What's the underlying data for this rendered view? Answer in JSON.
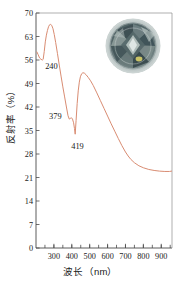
{
  "figure": {
    "name": "reflectance-spectrum-figure",
    "background": "#ffffff",
    "curve_color": "#d98c72",
    "axis_color": "#4a4a4a"
  },
  "axes": {
    "x_title": "波长（nm）",
    "y_title": "反射率（%）",
    "x_ticks": [
      "300",
      "400",
      "500",
      "600",
      "700",
      "800",
      "900"
    ],
    "y_ticks": [
      "0",
      "7",
      "14",
      "21",
      "28",
      "35",
      "42",
      "49",
      "56",
      "63",
      "70"
    ]
  },
  "annotations": [
    {
      "label": "240",
      "meaning": "absorption-dip-240nm"
    },
    {
      "label": "379",
      "meaning": "shoulder-379nm"
    },
    {
      "label": "419",
      "meaning": "absorption-minimum-419nm"
    }
  ],
  "inset": {
    "name": "gemstone-photo",
    "description": "round brilliant cut gemstone",
    "colors": {
      "rim": "#b9c3c4",
      "body_dark": "#2e3a3c",
      "body_mid": "#56686a",
      "body_light": "#9fb0ae",
      "highlight": "#e8eeec",
      "yellow_flash": "#d9d06a"
    }
  },
  "chart_data": {
    "type": "line",
    "title": "",
    "xlabel": "波长（nm）",
    "ylabel": "反射率（%）",
    "xlim": [
      200,
      960
    ],
    "ylim": [
      0,
      70
    ],
    "grid": false,
    "legend": "none",
    "series": [
      {
        "name": "reflectance",
        "color": "#d98c72",
        "x": [
          205,
          212,
          220,
          228,
          236,
          240,
          246,
          252,
          258,
          264,
          270,
          276,
          282,
          288,
          295,
          302,
          310,
          320,
          330,
          340,
          350,
          360,
          370,
          379,
          386,
          392,
          398,
          404,
          410,
          415,
          419,
          424,
          430,
          436,
          442,
          448,
          455,
          462,
          470,
          480,
          492,
          505,
          520,
          540,
          560,
          580,
          600,
          620,
          640,
          660,
          680,
          700,
          715,
          730,
          750,
          775,
          800,
          830,
          860,
          890,
          920,
          945,
          958
        ],
        "y": [
          58.4,
          57.6,
          56.6,
          56.2,
          56.0,
          56.2,
          58.5,
          61.4,
          63.4,
          64.8,
          65.9,
          66.5,
          66.6,
          66.3,
          65.3,
          63.6,
          61.2,
          57.9,
          54.5,
          51.2,
          48.0,
          45.0,
          42.0,
          39.4,
          38.4,
          38.6,
          38.8,
          38.4,
          37.3,
          35.6,
          33.9,
          38.0,
          43.0,
          46.8,
          49.4,
          51.0,
          51.9,
          52.2,
          52.1,
          51.6,
          50.8,
          49.8,
          48.4,
          46.2,
          43.9,
          41.6,
          39.3,
          37.0,
          34.8,
          32.6,
          30.5,
          28.6,
          27.4,
          26.4,
          25.4,
          24.5,
          23.9,
          23.4,
          23.1,
          22.9,
          22.8,
          22.8,
          22.9
        ],
        "annotated_points": [
          {
            "x": 240,
            "y": 56.0,
            "label": "240"
          },
          {
            "x": 379,
            "y": 39.4,
            "label": "379"
          },
          {
            "x": 419,
            "y": 33.9,
            "label": "419"
          }
        ]
      }
    ]
  }
}
